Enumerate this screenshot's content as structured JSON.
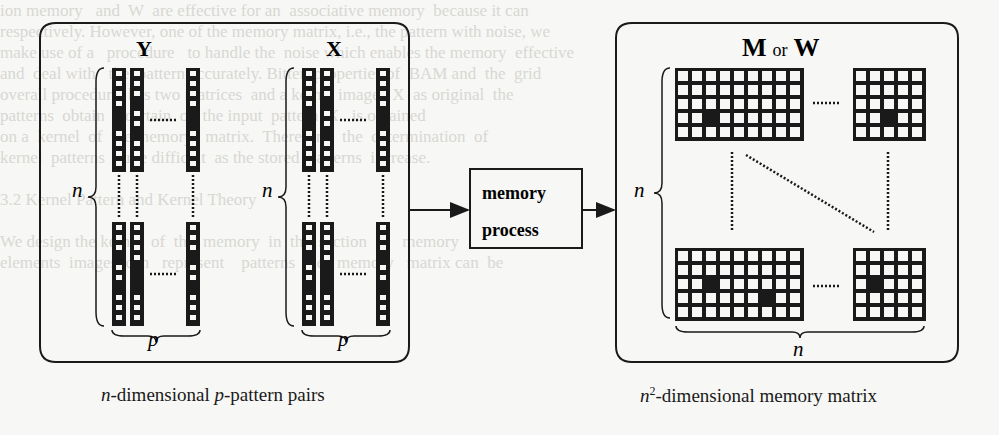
{
  "figure": {
    "left_panel": {
      "caption_parts": [
        "n",
        "-dimensional ",
        "p",
        "-pattern pairs"
      ],
      "groups": [
        {
          "label": "Y",
          "brace_side_label": "n",
          "brace_bottom_label": "p",
          "top_columns": [
            [
              0,
              0,
              0,
              0,
              1,
              1,
              0,
              0,
              0,
              0
            ],
            [
              0,
              0,
              0,
              1,
              0,
              0,
              1,
              0,
              0,
              0
            ],
            [
              0,
              0,
              0,
              0,
              1,
              1,
              0,
              0,
              0,
              0
            ]
          ],
          "bottom_columns": [
            [
              0,
              0,
              0,
              1,
              0,
              0,
              1,
              0,
              0,
              0
            ],
            [
              0,
              0,
              0,
              0,
              1,
              1,
              1,
              0,
              0,
              0
            ],
            [
              0,
              0,
              0,
              1,
              0,
              0,
              1,
              0,
              0,
              0
            ]
          ]
        },
        {
          "label": "X",
          "brace_side_label": "n",
          "brace_bottom_label": "p",
          "top_columns": [
            [
              0,
              0,
              0,
              0,
              1,
              1,
              0,
              0,
              0,
              0
            ],
            [
              0,
              0,
              0,
              1,
              0,
              0,
              1,
              0,
              0,
              0
            ],
            [
              0,
              0,
              0,
              0,
              1,
              1,
              0,
              0,
              0,
              0
            ]
          ],
          "bottom_columns": [
            [
              0,
              0,
              0,
              1,
              0,
              0,
              1,
              0,
              0,
              0
            ],
            [
              0,
              0,
              0,
              0,
              1,
              1,
              1,
              0,
              0,
              0
            ],
            [
              0,
              0,
              0,
              1,
              0,
              0,
              1,
              0,
              0,
              0
            ]
          ]
        }
      ]
    },
    "process_box": {
      "line1": "memory",
      "line2": "process"
    },
    "right_panel": {
      "title_left": "M",
      "title_mid": "or",
      "title_right": "W",
      "brace_side_label": "n",
      "brace_bottom_label": "n",
      "caption_sup": "2",
      "caption_var": "n",
      "caption_rest": "-dimensional memory matrix",
      "matrices": [
        {
          "position": "top-left",
          "cols": 9,
          "rows": 5,
          "dark": [
            [
              3,
              2
            ]
          ]
        },
        {
          "position": "top-right",
          "cols": 5,
          "rows": 5,
          "dark": [
            [
              3,
              2
            ]
          ]
        },
        {
          "position": "bottom-left",
          "cols": 9,
          "rows": 5,
          "dark": [
            [
              2,
              2
            ],
            [
              3,
              6
            ]
          ]
        },
        {
          "position": "bottom-right",
          "cols": 5,
          "rows": 5,
          "dark": [
            [
              2,
              1
            ]
          ]
        }
      ]
    },
    "ellipsis": "......"
  },
  "background_text": [
    "ion memory   and  W  are effective for an  associative memory  because it can",
    "respectively. However, one of the memory matrix, i.e., the pattern with noise, we",
    "make use of a   procedure   to handle the  noise which enables the memory  effective",
    "and  deal with   the  pattern accurately. Bitter  properties of  BAM and  the  grid",
    "overall procedure  has two matrices  and a kernel image.  X  as original  the",
    "patterns  obtain  a certain  of  the input  pattern  X   is obtained",
    "on a  kernel  of  the memory   matrix.  Therefore,  the  determination  of",
    "kernel  patterns  quite difficult  as the stored  patterns  increase.",
    "",
    "3.2 Kernel Pattern and Kernel Theory",
    "",
    "We design the kernel  of  the  memory  in  this section  as   memory    kernel",
    "elements  images  can   represent    patterns  the   memory   matrix can  be"
  ]
}
